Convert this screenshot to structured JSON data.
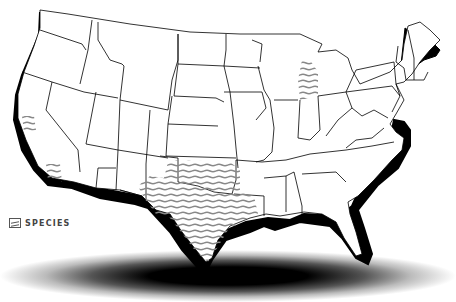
{
  "map": {
    "subject": "Contiguous United States",
    "fill_color": "#ffffff",
    "border_color": "#000000",
    "coast_shadow_color": "#000000",
    "hatch_color": "#888888"
  },
  "legend": {
    "items": [
      {
        "label": "SPECIES",
        "swatch": "hatched-lines"
      }
    ]
  },
  "species_range": {
    "regions": [
      "Texas",
      "Oklahoma",
      "Michigan (Lower Peninsula)",
      "Coastal California"
    ]
  }
}
